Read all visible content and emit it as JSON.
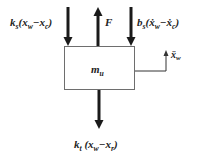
{
  "diagram": {
    "mass": {
      "symbol": "m",
      "subscript": "u"
    },
    "forces": {
      "spring_top": {
        "coef": "k",
        "coef_sub": "s",
        "open": "(",
        "a": "x",
        "a_sub": "w",
        "minus": "−",
        "b": "x",
        "b_sub": "c",
        "close": ")",
        "direction": "down"
      },
      "actuator": {
        "label": "F",
        "direction": "up"
      },
      "damper": {
        "coef": "b",
        "coef_sub": "s",
        "open": "(",
        "a": "ẋ",
        "a_sub": "w",
        "minus": "−",
        "b": "ẋ",
        "b_sub": "c",
        "close": ")",
        "direction": "down"
      },
      "tire": {
        "coef": "k",
        "coef_sub": "t",
        "open": "(",
        "a": "x",
        "a_sub": "w",
        "minus": "−",
        "b": "x",
        "b_sub": "r",
        "close": ")",
        "direction": "down"
      }
    },
    "acceleration": {
      "symbol": "ẍ",
      "subscript": "w"
    },
    "colors": {
      "stroke": "#1a1a1a",
      "box": "#777777",
      "background": "#ffffff"
    }
  }
}
